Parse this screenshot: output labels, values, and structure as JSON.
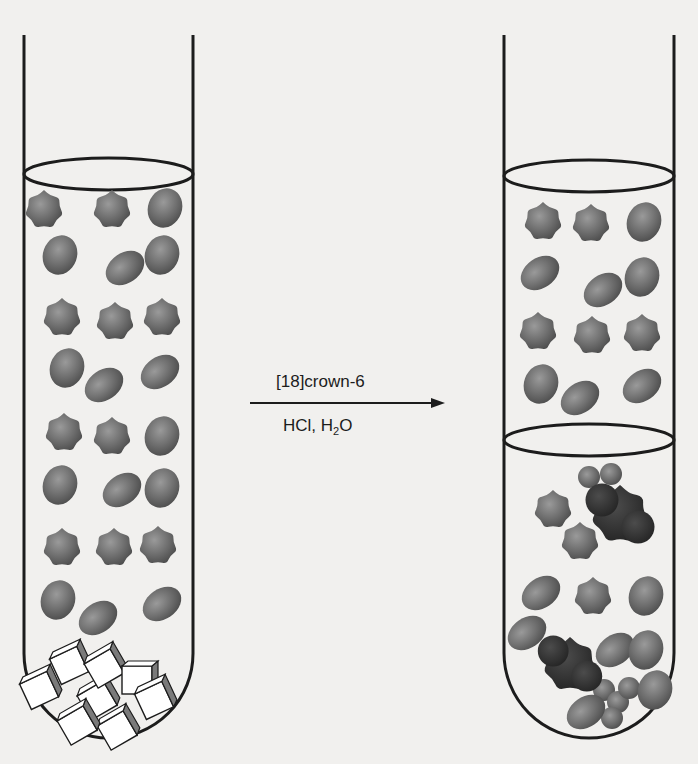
{
  "reaction": {
    "reagent_above": "[18]crown-6",
    "reagent_below_prefix": "HCl, H",
    "reagent_below_sub": "2",
    "reagent_below_suffix": "O"
  },
  "colors": {
    "background": "#f1f0ee",
    "line": "#1c1c1c",
    "molecule": "#6e6e6e",
    "molecule_dark": "#3a3a3a",
    "crystal_fill": "#ffffff",
    "crystal_shade": "#7a7a7a"
  },
  "left_tube": {
    "label": "before: organic solvent with insoluble salt crystals",
    "x_left": 24,
    "x_right": 193,
    "top": 35,
    "bottom": 738,
    "meniscus_y": 174,
    "molecules": [
      [
        44,
        210,
        "star"
      ],
      [
        112,
        210,
        "star"
      ],
      [
        165,
        208,
        "blob"
      ],
      [
        60,
        255,
        "blob"
      ],
      [
        125,
        268,
        "oval"
      ],
      [
        162,
        255,
        "blob"
      ],
      [
        62,
        318,
        "star"
      ],
      [
        115,
        322,
        "star"
      ],
      [
        162,
        318,
        "star"
      ],
      [
        67,
        368,
        "blob"
      ],
      [
        104,
        385,
        "oval"
      ],
      [
        160,
        372,
        "oval"
      ],
      [
        64,
        433,
        "star"
      ],
      [
        112,
        437,
        "star"
      ],
      [
        162,
        436,
        "blob"
      ],
      [
        60,
        485,
        "blob"
      ],
      [
        122,
        490,
        "oval"
      ],
      [
        162,
        488,
        "blob"
      ],
      [
        62,
        548,
        "star"
      ],
      [
        114,
        548,
        "star"
      ],
      [
        158,
        546,
        "star"
      ],
      [
        58,
        600,
        "blob"
      ],
      [
        98,
        618,
        "oval"
      ],
      [
        162,
        604,
        "oval"
      ]
    ],
    "crystals": [
      [
        40,
        690,
        -25
      ],
      [
        70,
        665,
        -25
      ],
      [
        98,
        700,
        -30
      ],
      [
        105,
        668,
        -30
      ],
      [
        138,
        680,
        0
      ],
      [
        118,
        730,
        -30
      ],
      [
        155,
        700,
        -25
      ],
      [
        78,
        725,
        -30
      ]
    ]
  },
  "right_tube": {
    "label": "after: two-phase system, salt dissolved as crown complex",
    "x_left": 504,
    "x_right": 674,
    "top": 35,
    "bottom": 738,
    "meniscus_y": 176,
    "interface_y": 440,
    "molecules": [
      [
        543,
        222,
        "star"
      ],
      [
        591,
        224,
        "star"
      ],
      [
        644,
        222,
        "blob"
      ],
      [
        540,
        273,
        "oval"
      ],
      [
        603,
        290,
        "oval"
      ],
      [
        642,
        277,
        "blob"
      ],
      [
        538,
        332,
        "star"
      ],
      [
        592,
        336,
        "star"
      ],
      [
        642,
        334,
        "star"
      ],
      [
        541,
        384,
        "blob"
      ],
      [
        580,
        398,
        "oval"
      ],
      [
        642,
        386,
        "oval"
      ],
      [
        553,
        510,
        "star"
      ],
      [
        580,
        542,
        "star"
      ],
      [
        541,
        593,
        "oval"
      ],
      [
        593,
        597,
        "star"
      ],
      [
        646,
        596,
        "blob"
      ],
      [
        527,
        633,
        "oval"
      ],
      [
        615,
        650,
        "oval"
      ],
      [
        646,
        650,
        "blob"
      ],
      [
        655,
        690,
        "blob"
      ],
      [
        586,
        712,
        "oval"
      ]
    ],
    "dark_complexes": [
      [
        620,
        515,
        30
      ],
      [
        570,
        665,
        28
      ]
    ],
    "small_spheres": [
      [
        589,
        477
      ],
      [
        611,
        474
      ],
      [
        604,
        690
      ],
      [
        618,
        702
      ],
      [
        629,
        688
      ],
      [
        612,
        718
      ]
    ]
  },
  "arrow": {
    "x1": 250,
    "x2": 445,
    "y": 403
  }
}
